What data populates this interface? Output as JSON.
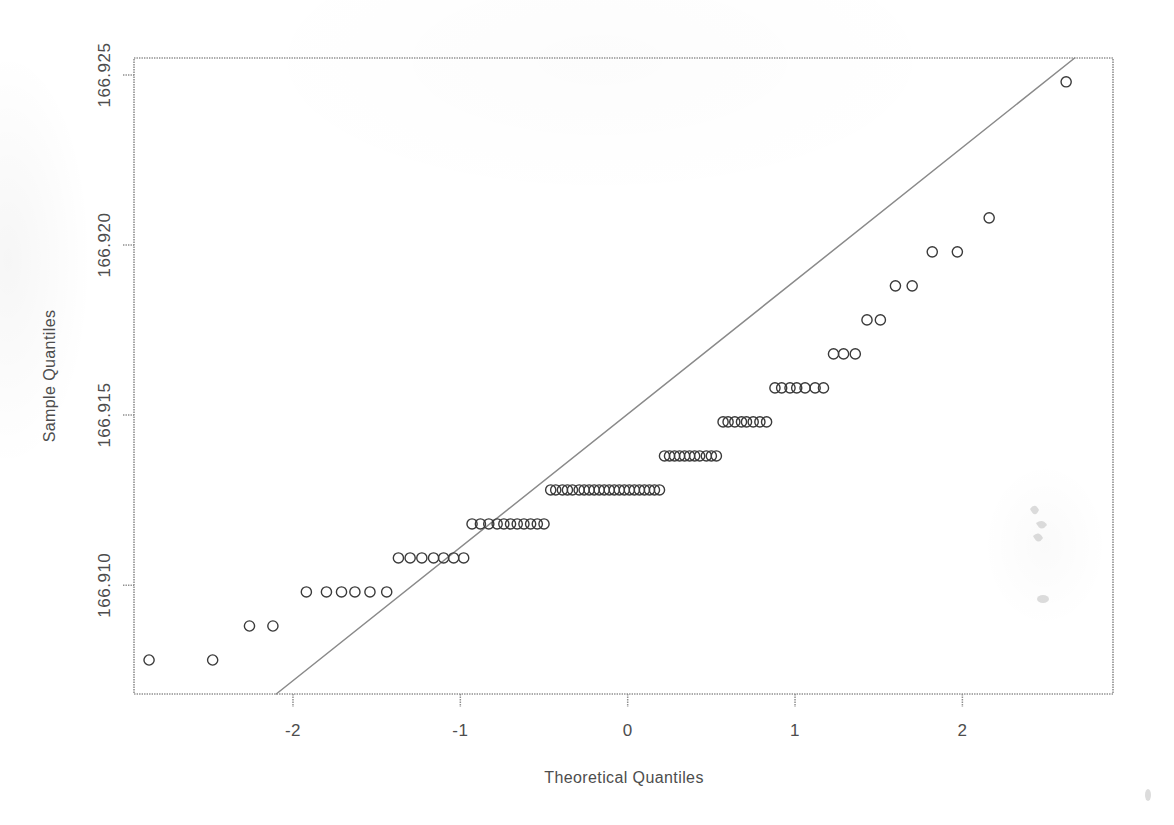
{
  "figure": {
    "kind": "qq-plot",
    "background_color": "#ffffff",
    "ink_color": "#4d4d4d",
    "line_color": "#8a8a8a",
    "point_color": "#3a3a3a"
  },
  "chart_data": {
    "type": "scatter",
    "title": "",
    "subtitle": "",
    "xlabel": "Theoretical Quantiles",
    "ylabel": "Sample Quantiles",
    "grid": false,
    "legend": null,
    "xlim": [
      -2.95,
      2.9
    ],
    "ylim": [
      166.9068,
      166.9255
    ],
    "xticks": [
      -2,
      -1,
      0,
      1,
      2
    ],
    "xticklabels": [
      "-2",
      "-1",
      "0",
      "1",
      "2"
    ],
    "yticks": [
      166.91,
      166.915,
      166.92,
      166.925
    ],
    "yticklabels": [
      "166.910",
      "166.915",
      "166.920",
      "166.925"
    ],
    "reference_line": {
      "kind": "qqline",
      "note": "straight line through first and third quartiles",
      "x_start": -2.1,
      "y_start": 166.9068,
      "x_end": 2.62,
      "y_end": 166.9253
    },
    "marker": "open-circle",
    "n_points": 118,
    "points": [
      {
        "x": -2.86,
        "y": 166.9078
      },
      {
        "x": -2.48,
        "y": 166.9078
      },
      {
        "x": -2.26,
        "y": 166.9088
      },
      {
        "x": -2.12,
        "y": 166.9088
      },
      {
        "x": -1.92,
        "y": 166.9098
      },
      {
        "x": -1.8,
        "y": 166.9098
      },
      {
        "x": -1.71,
        "y": 166.9098
      },
      {
        "x": -1.63,
        "y": 166.9098
      },
      {
        "x": -1.54,
        "y": 166.9098
      },
      {
        "x": -1.44,
        "y": 166.9098
      },
      {
        "x": -1.37,
        "y": 166.9108
      },
      {
        "x": -1.3,
        "y": 166.9108
      },
      {
        "x": -1.23,
        "y": 166.9108
      },
      {
        "x": -1.16,
        "y": 166.9108
      },
      {
        "x": -1.1,
        "y": 166.9108
      },
      {
        "x": -1.04,
        "y": 166.9108
      },
      {
        "x": -0.98,
        "y": 166.9108
      },
      {
        "x": -0.93,
        "y": 166.9118
      },
      {
        "x": -0.88,
        "y": 166.9118
      },
      {
        "x": -0.83,
        "y": 166.9118
      },
      {
        "x": -0.78,
        "y": 166.9118
      },
      {
        "x": -0.74,
        "y": 166.9118
      },
      {
        "x": -0.7,
        "y": 166.9118
      },
      {
        "x": -0.66,
        "y": 166.9118
      },
      {
        "x": -0.62,
        "y": 166.9118
      },
      {
        "x": -0.58,
        "y": 166.9118
      },
      {
        "x": -0.54,
        "y": 166.9118
      },
      {
        "x": -0.5,
        "y": 166.9118
      },
      {
        "x": -0.46,
        "y": 166.9128
      },
      {
        "x": -0.43,
        "y": 166.9128
      },
      {
        "x": -0.39,
        "y": 166.9128
      },
      {
        "x": -0.36,
        "y": 166.9128
      },
      {
        "x": -0.33,
        "y": 166.9128
      },
      {
        "x": -0.29,
        "y": 166.9128
      },
      {
        "x": -0.26,
        "y": 166.9128
      },
      {
        "x": -0.23,
        "y": 166.9128
      },
      {
        "x": -0.2,
        "y": 166.9128
      },
      {
        "x": -0.17,
        "y": 166.9128
      },
      {
        "x": -0.14,
        "y": 166.9128
      },
      {
        "x": -0.11,
        "y": 166.9128
      },
      {
        "x": -0.08,
        "y": 166.9128
      },
      {
        "x": -0.05,
        "y": 166.9128
      },
      {
        "x": -0.02,
        "y": 166.9128
      },
      {
        "x": 0.01,
        "y": 166.9128
      },
      {
        "x": 0.04,
        "y": 166.9128
      },
      {
        "x": 0.07,
        "y": 166.9128
      },
      {
        "x": 0.1,
        "y": 166.9128
      },
      {
        "x": 0.13,
        "y": 166.9128
      },
      {
        "x": 0.16,
        "y": 166.9128
      },
      {
        "x": 0.19,
        "y": 166.9128
      },
      {
        "x": 0.22,
        "y": 166.9138
      },
      {
        "x": 0.25,
        "y": 166.9138
      },
      {
        "x": 0.28,
        "y": 166.9138
      },
      {
        "x": 0.31,
        "y": 166.9138
      },
      {
        "x": 0.34,
        "y": 166.9138
      },
      {
        "x": 0.37,
        "y": 166.9138
      },
      {
        "x": 0.4,
        "y": 166.9138
      },
      {
        "x": 0.43,
        "y": 166.9138
      },
      {
        "x": 0.47,
        "y": 166.9138
      },
      {
        "x": 0.5,
        "y": 166.9138
      },
      {
        "x": 0.53,
        "y": 166.9138
      },
      {
        "x": 0.57,
        "y": 166.9148
      },
      {
        "x": 0.6,
        "y": 166.9148
      },
      {
        "x": 0.64,
        "y": 166.9148
      },
      {
        "x": 0.68,
        "y": 166.9148
      },
      {
        "x": 0.71,
        "y": 166.9148
      },
      {
        "x": 0.75,
        "y": 166.9148
      },
      {
        "x": 0.79,
        "y": 166.9148
      },
      {
        "x": 0.83,
        "y": 166.9148
      },
      {
        "x": 0.88,
        "y": 166.9158
      },
      {
        "x": 0.92,
        "y": 166.9158
      },
      {
        "x": 0.97,
        "y": 166.9158
      },
      {
        "x": 1.01,
        "y": 166.9158
      },
      {
        "x": 1.06,
        "y": 166.9158
      },
      {
        "x": 1.12,
        "y": 166.9158
      },
      {
        "x": 1.17,
        "y": 166.9158
      },
      {
        "x": 1.23,
        "y": 166.9168
      },
      {
        "x": 1.29,
        "y": 166.9168
      },
      {
        "x": 1.36,
        "y": 166.9168
      },
      {
        "x": 1.43,
        "y": 166.9178
      },
      {
        "x": 1.51,
        "y": 166.9178
      },
      {
        "x": 1.6,
        "y": 166.9188
      },
      {
        "x": 1.7,
        "y": 166.9188
      },
      {
        "x": 1.82,
        "y": 166.9198
      },
      {
        "x": 1.97,
        "y": 166.9198
      },
      {
        "x": 2.16,
        "y": 166.9208
      },
      {
        "x": 2.62,
        "y": 166.9248
      }
    ],
    "bands": [
      {
        "y": 166.9078,
        "count": 2,
        "x_from": -2.86,
        "x_to": -2.48
      },
      {
        "y": 166.9088,
        "count": 2,
        "x_from": -2.26,
        "x_to": -2.12
      },
      {
        "y": 166.9098,
        "count": 6,
        "x_from": -1.92,
        "x_to": -1.44
      },
      {
        "y": 166.9108,
        "count": 7,
        "x_from": -1.37,
        "x_to": -0.98
      },
      {
        "y": 166.9118,
        "count": 11,
        "x_from": -0.93,
        "x_to": -0.5
      },
      {
        "y": 166.9128,
        "count": 22,
        "x_from": -0.46,
        "x_to": 0.19
      },
      {
        "y": 166.9138,
        "count": 11,
        "x_from": 0.22,
        "x_to": 0.53
      },
      {
        "y": 166.9148,
        "count": 8,
        "x_from": 0.57,
        "x_to": 0.83
      },
      {
        "y": 166.9158,
        "count": 7,
        "x_from": 0.88,
        "x_to": 1.17
      },
      {
        "y": 166.9168,
        "count": 3,
        "x_from": 1.23,
        "x_to": 1.36
      },
      {
        "y": 166.9178,
        "count": 2,
        "x_from": 1.43,
        "x_to": 1.51
      },
      {
        "y": 166.9188,
        "count": 2,
        "x_from": 1.6,
        "x_to": 1.7
      },
      {
        "y": 166.9198,
        "count": 2,
        "x_from": 1.82,
        "x_to": 1.97
      },
      {
        "y": 166.9208,
        "count": 1,
        "x_from": 2.16,
        "x_to": 2.16
      },
      {
        "y": 166.9248,
        "count": 1,
        "x_from": 2.62,
        "x_to": 2.62
      }
    ]
  }
}
